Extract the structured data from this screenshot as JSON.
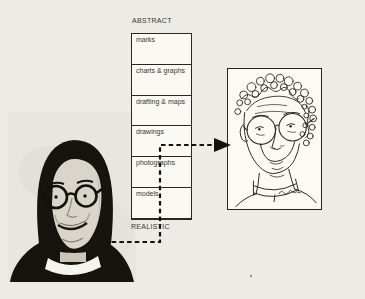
{
  "figure": {
    "scale": {
      "top_label": "ABSTRACT",
      "bottom_label": "REALISTIC",
      "levels": [
        "marks",
        "charts & graphs",
        "drafting & maps",
        "drawings",
        "photographs",
        "models"
      ]
    },
    "photo": {
      "description": "black-and-white halftone photograph of a man with dark hair, round glasses and white collar"
    },
    "sketch": {
      "description": "contour line drawing of the same man with curly hair and round glasses, signed by the artist"
    },
    "arrow": {
      "path": "from photograph, up the scale, pointing to the drawing"
    },
    "colors": {
      "page_bg": "#edebe5",
      "box_fill": "#faf9f4",
      "ink": "#2b2823",
      "photo_backdrop": "#e8e6e0"
    }
  }
}
